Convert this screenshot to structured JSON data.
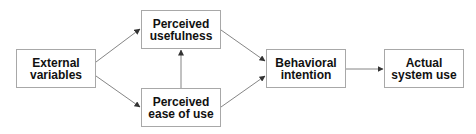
{
  "diagram": {
    "type": "flowchart",
    "title": "",
    "colors": {
      "box_border": "#a8a8a8",
      "arrow": "#555555",
      "text": "#111111",
      "background": "#ffffff"
    },
    "nodes": [
      {
        "id": "external",
        "line1": "External",
        "line2": "variables",
        "x": 16,
        "y": 49,
        "w": 80,
        "h": 39
      },
      {
        "id": "usefulness",
        "line1": "Perceived",
        "line2": "usefulness",
        "x": 141,
        "y": 10,
        "w": 80,
        "h": 39
      },
      {
        "id": "ease",
        "line1": "Perceived",
        "line2": "ease of use",
        "x": 141,
        "y": 88,
        "w": 80,
        "h": 39
      },
      {
        "id": "intention",
        "line1": "Behavioral",
        "line2": "intention",
        "x": 266,
        "y": 49,
        "w": 80,
        "h": 39
      },
      {
        "id": "actual",
        "line1": "Actual",
        "line2": "system use",
        "x": 384,
        "y": 49,
        "w": 80,
        "h": 39
      }
    ],
    "edges": [
      {
        "from": "external",
        "to": "usefulness"
      },
      {
        "from": "external",
        "to": "ease"
      },
      {
        "from": "ease",
        "to": "usefulness"
      },
      {
        "from": "usefulness",
        "to": "intention"
      },
      {
        "from": "ease",
        "to": "intention"
      },
      {
        "from": "intention",
        "to": "actual"
      }
    ]
  }
}
